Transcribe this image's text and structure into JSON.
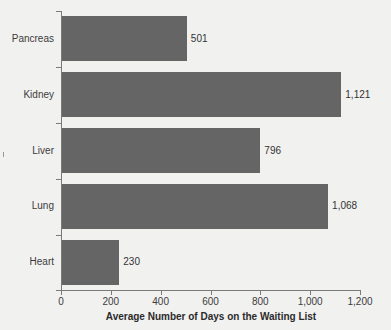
{
  "chart_data": {
    "type": "bar",
    "orientation": "horizontal",
    "title": "",
    "xlabel": "Average Number of Days on the Waiting List",
    "ylabel": "",
    "categories": [
      "Pancreas",
      "Kidney",
      "Liver",
      "Lung",
      "Heart"
    ],
    "values": [
      501,
      1121,
      796,
      1068,
      230
    ],
    "value_labels": [
      "501",
      "1,121",
      "796",
      "1,068",
      "230"
    ],
    "xlim": [
      0,
      1200
    ],
    "xticks": [
      0,
      200,
      400,
      600,
      800,
      1000,
      1200
    ],
    "xtick_labels": [
      "0",
      "200",
      "400",
      "600",
      "800",
      "1,000",
      "1,200"
    ],
    "grid": false,
    "legend": null,
    "bar_color": "#656565",
    "background_color": "#f1f1f0",
    "axis_color": "#7a7a7a",
    "text_color": "#3c3c3c"
  }
}
